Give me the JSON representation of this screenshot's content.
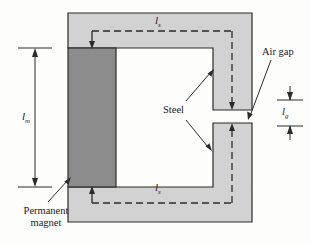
{
  "figure": {
    "type": "magnetic-circuit-cross-section",
    "title": "",
    "background_color": "#fdfdfb",
    "colors": {
      "steel": "#d2d2d2",
      "steel_outline": "#2b2b2b",
      "permanent_magnet": "#8c8c8c",
      "magnet_outline": "#2b2b2b",
      "cavity": "#ffffff",
      "flux_path": "#2b2b2b",
      "leader_line": "#2b2b2b",
      "dimension_line": "#2b2b2b",
      "text": "#1a1a1a"
    }
  },
  "labels": {
    "air_gap": "Air gap",
    "steel": "Steel",
    "permanent_magnet_line1": "Permanent",
    "permanent_magnet_line2": "magnet",
    "l_m": "l",
    "l_m_sub": "m",
    "l_s_top": "l",
    "l_s_top_sub": "s",
    "l_s_bottom": "l",
    "l_s_bottom_sub": "s",
    "l_g": "l",
    "l_g_sub": "g"
  },
  "dimensions": {
    "l_m_description": "magnet length, vertical double arrow on left",
    "l_s_description": "steel path length, horizontal dashed flux segments top and bottom",
    "l_g_description": "air gap length, vertical double arrow on right"
  },
  "geometry": {
    "core_outer": {
      "x": 68,
      "y": 13,
      "width": 184,
      "height": 209
    },
    "cavity": {
      "x": 116,
      "y": 48,
      "width": 97,
      "height": 139
    },
    "magnet": {
      "x": 68,
      "y": 48,
      "width": 48,
      "height": 139
    },
    "air_gap_slot": {
      "x": 213,
      "y": 110,
      "width": 39,
      "height": 13
    }
  }
}
